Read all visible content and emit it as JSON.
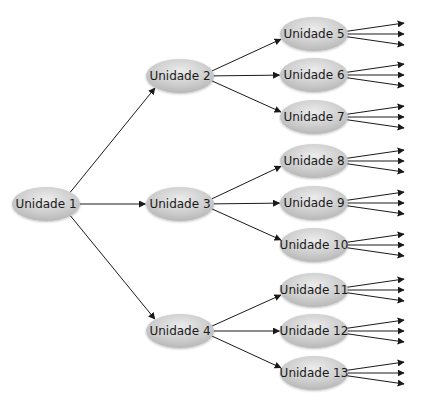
{
  "diagram": {
    "type": "tree",
    "direction": "left-to-right",
    "node_style": {
      "fill": "#c9c9c9",
      "highlight": "#e6e6e6",
      "text_color": "#1a1a1a",
      "edge_color": "#1a1a1a"
    },
    "root": {
      "id": "u1",
      "label": "Unidade 1"
    },
    "level1": [
      {
        "id": "u2",
        "label": "Unidade 2",
        "parent": "u1"
      },
      {
        "id": "u3",
        "label": "Unidade 3",
        "parent": "u1"
      },
      {
        "id": "u4",
        "label": "Unidade 4",
        "parent": "u1"
      }
    ],
    "level2": [
      {
        "id": "u5",
        "label": "Unidade 5",
        "parent": "u2",
        "outgoing_arrows": 3
      },
      {
        "id": "u6",
        "label": "Unidade 6",
        "parent": "u2",
        "outgoing_arrows": 3
      },
      {
        "id": "u7",
        "label": "Unidade 7",
        "parent": "u2",
        "outgoing_arrows": 3
      },
      {
        "id": "u8",
        "label": "Unidade 8",
        "parent": "u3",
        "outgoing_arrows": 3
      },
      {
        "id": "u9",
        "label": "Unidade 9",
        "parent": "u3",
        "outgoing_arrows": 3
      },
      {
        "id": "u10",
        "label": "Unidade 10",
        "parent": "u3",
        "outgoing_arrows": 3
      },
      {
        "id": "u11",
        "label": "Unidade 11",
        "parent": "u4",
        "outgoing_arrows": 3
      },
      {
        "id": "u12",
        "label": "Unidade 12",
        "parent": "u4",
        "outgoing_arrows": 3
      },
      {
        "id": "u13",
        "label": "Unidade 13",
        "parent": "u4",
        "outgoing_arrows": 3
      }
    ]
  }
}
